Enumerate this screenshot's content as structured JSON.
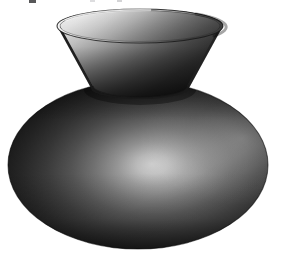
{
  "image": {
    "title": "Shaded 3D vase render",
    "subject": "vase",
    "render_style": "smooth-shaded grayscale raster render",
    "background_color": "#ffffff",
    "width": 282,
    "height": 258
  },
  "lighting": {
    "description": "single light source from upper-left",
    "light_direction": "upper-left",
    "highlight_color": "#f2f2f2",
    "midtone_color": "#6e6e6e",
    "shadow_color": "#161616",
    "deep_shadow_color": "#0b0b0b",
    "specular_highlight": {
      "label": "body specular highlight",
      "center_x": 152,
      "center_y": 164,
      "radius_x": 62,
      "radius_y": 26,
      "peak_color": "#dedede"
    }
  },
  "geometry": {
    "body": {
      "name": "oblate spheroid body",
      "center_x": 138,
      "center_y": 165,
      "radius_x": 130,
      "radius_y": 84,
      "left_edge_x": 8,
      "right_edge_x": 268,
      "top_edge_y": 81,
      "bottom_edge_y": 249
    },
    "neck": {
      "name": "flared conical neck",
      "rim_center_x": 140,
      "rim_center_y": 26,
      "rim_radius_x": 83,
      "rim_radius_y": 17,
      "base_center_x": 140,
      "base_center_y": 88,
      "base_radius_x": 49,
      "base_radius_y": 11,
      "top_edge_y": 9,
      "bottom_edge_y": 99
    },
    "interior": {
      "name": "neck interior cavity",
      "visible": true,
      "shading": "bright on upper-left wall, dark on right wall"
    }
  },
  "artifacts": [
    {
      "name": "scan-speck-left",
      "x": 29,
      "y": 0,
      "width": 7,
      "height": 3,
      "color": "#3a3a3c",
      "opacity": 0.85
    },
    {
      "name": "scan-speck-mid",
      "x": 90,
      "y": 0,
      "width": 5,
      "height": 2,
      "color": "#cfcfd2",
      "opacity": 0.7
    },
    {
      "name": "scan-speck-right",
      "x": 117,
      "y": 0,
      "width": 5,
      "height": 2,
      "color": "#b8b8bb",
      "opacity": 0.6
    }
  ],
  "chart_data": {
    "type": "scatter",
    "title": "Shaded 3D vase render",
    "xlabel": "",
    "ylabel": "",
    "categories": [
      "rim-highlight",
      "interior-left",
      "interior-right",
      "neck-outer",
      "body-upper-left",
      "body-highlight",
      "body-lower-left",
      "body-right"
    ],
    "values": [
      242,
      214,
      74,
      34,
      58,
      222,
      16,
      112
    ],
    "series": [
      {
        "name": "sampled luminance (0-255)",
        "values": [
          242,
          214,
          74,
          34,
          58,
          222,
          16,
          112
        ]
      }
    ],
    "ylim": [
      0,
      255
    ],
    "grid": false,
    "legend_position": "none"
  }
}
